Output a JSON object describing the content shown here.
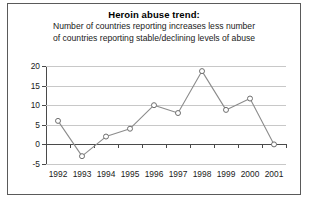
{
  "chart_data": {
    "type": "line",
    "title": "Heroin abuse trend:",
    "subtitle_lines": [
      "Number of countries reporting increases less number",
      "of countries reporting stable/declining levels of abuse"
    ],
    "categories": [
      "1992",
      "1993",
      "1994",
      "1995",
      "1996",
      "1997",
      "1998",
      "1999",
      "2000",
      "2001"
    ],
    "values": [
      6,
      -3,
      2,
      4,
      10,
      8,
      18.7,
      8.8,
      11.7,
      0
    ],
    "xlabel": "",
    "ylabel": "",
    "ylim": [
      -5,
      20
    ],
    "yticks": [
      20,
      15,
      10,
      5,
      0,
      -5
    ],
    "ytick_labels": [
      "20",
      "15",
      "10",
      "5",
      "0",
      "-5"
    ],
    "grid": true,
    "legend": false,
    "marker": "open-circle",
    "line_color": "#8c8c8c",
    "grid_color": "#c8c8c8",
    "axis_color": "#4a4a4a",
    "zero_line": 0
  }
}
